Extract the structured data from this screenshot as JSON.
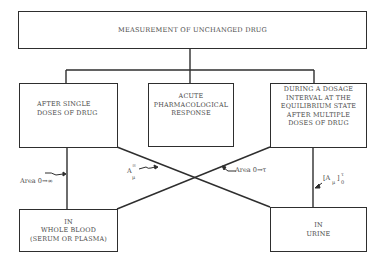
{
  "diagram": {
    "title": "MEASUREMENT OF UNCHANGED DRUG",
    "conditions": [
      {
        "id": "single",
        "lines": [
          "AFTER SINGLE",
          "DOSES OF DRUG"
        ]
      },
      {
        "id": "acute",
        "lines": [
          "ACUTE",
          "PHARMACOLOGICAL",
          "RESPONSE"
        ]
      },
      {
        "id": "multiple",
        "lines": [
          "DURING A DOSAGE",
          "INTERVAL AT THE",
          "EQUILIBRIUM STATE",
          "AFTER MULTIPLE",
          "DOSES OF DRUG"
        ]
      }
    ],
    "media": [
      {
        "id": "blood",
        "lines": [
          "IN",
          "WHOLE BLOOD",
          "(SERUM OR PLASMA)"
        ]
      },
      {
        "id": "urine",
        "lines": [
          "IN",
          "URINE"
        ]
      }
    ],
    "edge_labels": {
      "area_inf": "Area 0→∞",
      "area_tau": "Area 0→τ",
      "a_mu_inf": {
        "base": "A",
        "sup": "∞",
        "sub": "μ"
      },
      "a_mu_tau": {
        "base": "[A",
        "sub": "μ",
        "close": "]",
        "sup": "τ",
        "sub2": "0"
      }
    }
  }
}
